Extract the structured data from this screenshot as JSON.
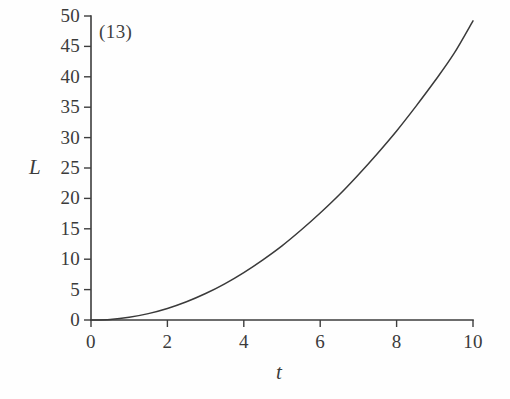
{
  "figure": {
    "panel_label": "(13)",
    "background_color": "#fefefe",
    "ink_color": "#3a3a3a"
  },
  "axes": {
    "y_label": "L",
    "x_label": "t"
  },
  "chart_data": {
    "type": "line",
    "title": "",
    "subtitle": "",
    "annotations": [
      "(13)"
    ],
    "xlabel": "t",
    "ylabel": "L",
    "xlim": [
      0,
      10
    ],
    "ylim": [
      0,
      50
    ],
    "grid": false,
    "legend": "none",
    "xticks": [
      0,
      2,
      4,
      6,
      8,
      10
    ],
    "xtick_labels": [
      "0",
      "2",
      "4",
      "6",
      "8",
      "10"
    ],
    "yticks": [
      0,
      5,
      10,
      15,
      20,
      25,
      30,
      35,
      40,
      45,
      50
    ],
    "ytick_labels": [
      "0",
      "5",
      "10",
      "15",
      "20",
      "25",
      "30",
      "35",
      "40",
      "45",
      "50"
    ],
    "series": [
      {
        "name": "L(t)",
        "color": "#3a3a3a",
        "x": [
          0,
          0.5,
          1,
          1.5,
          2,
          2.5,
          3,
          3.5,
          4,
          4.5,
          5,
          5.5,
          6,
          6.5,
          7,
          7.5,
          8,
          8.5,
          9,
          9.5,
          10
        ],
        "values": [
          0,
          0.1,
          0.45,
          1.05,
          1.9,
          3.0,
          4.35,
          5.95,
          7.8,
          9.9,
          12.2,
          14.8,
          17.6,
          20.6,
          23.9,
          27.4,
          31.1,
          35.1,
          39.3,
          43.8,
          49.2
        ]
      }
    ]
  },
  "ticks": {
    "y": [
      {
        "label": "50",
        "value": 50
      },
      {
        "label": "45",
        "value": 45
      },
      {
        "label": "40",
        "value": 40
      },
      {
        "label": "35",
        "value": 35
      },
      {
        "label": "30",
        "value": 30
      },
      {
        "label": "25",
        "value": 25
      },
      {
        "label": "20",
        "value": 20
      },
      {
        "label": "15",
        "value": 15
      },
      {
        "label": "10",
        "value": 10
      },
      {
        "label": "5",
        "value": 5
      },
      {
        "label": "0",
        "value": 0
      }
    ],
    "x": [
      {
        "label": "0",
        "value": 0
      },
      {
        "label": "2",
        "value": 2
      },
      {
        "label": "4",
        "value": 4
      },
      {
        "label": "6",
        "value": 6
      },
      {
        "label": "8",
        "value": 8
      },
      {
        "label": "10",
        "value": 10
      }
    ]
  }
}
